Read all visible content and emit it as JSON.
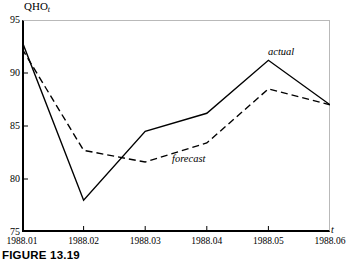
{
  "caption": "FIGURE 13.19",
  "chart_data": {
    "type": "line",
    "title": "",
    "ylabel": "QHO",
    "ylabel_subscript": "t",
    "xlabel": "t",
    "categories": [
      "1988.01",
      "1988.02",
      "1988.03",
      "1988.04",
      "1988.05",
      "1988.06"
    ],
    "x": [
      1,
      2,
      3,
      4,
      5,
      6
    ],
    "ylim": [
      75,
      95
    ],
    "yticks": [
      75,
      80,
      85,
      90,
      95
    ],
    "ytick_labels": [
      "75",
      "80",
      "85",
      "90",
      "95"
    ],
    "xlim": [
      1,
      6
    ],
    "grid": false,
    "legend": "inline-annotations",
    "series": [
      {
        "name": "actual",
        "style": "solid",
        "color": "#000000",
        "values": [
          93.0,
          78.0,
          84.5,
          86.2,
          91.2,
          87.0
        ]
      },
      {
        "name": "forecast",
        "style": "dashed",
        "color": "#000000",
        "values": [
          92.3,
          82.7,
          81.6,
          83.4,
          88.5,
          87.0
        ]
      }
    ],
    "annotations": [
      {
        "text": "actual",
        "series": "actual"
      },
      {
        "text": "forecast",
        "series": "forecast"
      }
    ]
  }
}
